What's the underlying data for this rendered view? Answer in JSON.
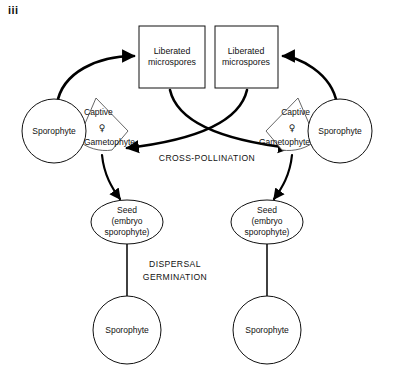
{
  "figure": {
    "label": "iii",
    "colors": {
      "stroke": "#111111",
      "background": "#ffffff",
      "arrow": "#000000"
    }
  },
  "nodes": {
    "microspore_box_left": {
      "line1": "Liberated",
      "line2": "microspores"
    },
    "microspore_box_right": {
      "line1": "Liberated",
      "line2": "microspores"
    },
    "sporophyte_left": "Sporophyte",
    "sporophyte_right": "Sporophyte",
    "gametophyte_left": {
      "captive": "Captive",
      "symbol": "♀",
      "name": "Gametophyte"
    },
    "gametophyte_right": {
      "captive": "Captive",
      "symbol": "♀",
      "name": "Gametophyte"
    },
    "seed_left": {
      "line1": "Seed",
      "line2": "(embryo",
      "line3": "sporophyte)"
    },
    "seed_right": {
      "line1": "Seed",
      "line2": "(embryo",
      "line3": "sporophyte)"
    },
    "offspring_sporophyte_left": "Sporophyte",
    "offspring_sporophyte_right": "Sporophyte"
  },
  "process_labels": {
    "cross_pollination": "CROSS-POLLINATION",
    "dispersal": "DISPERSAL",
    "germination": "GERMINATION"
  }
}
